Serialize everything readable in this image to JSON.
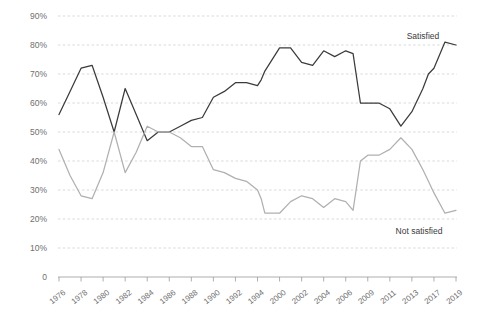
{
  "chart_data": {
    "type": "line",
    "title": "",
    "subtitle": "",
    "xlabel": "",
    "ylabel": "",
    "grid": true,
    "legend_position": "inline-end-labels",
    "ylim": [
      0,
      90
    ],
    "ytick_labels": [
      "90%",
      "80%",
      "70%",
      "60%",
      "50%",
      "40%",
      "30%",
      "20%",
      "10%",
      "0"
    ],
    "ytick_values": [
      90,
      80,
      70,
      60,
      50,
      40,
      30,
      20,
      10,
      0
    ],
    "categories": [
      "1976",
      "1978",
      "1980",
      "1982",
      "1984",
      "1986",
      "1988",
      "1990",
      "1992",
      "1994",
      "2000",
      "2002",
      "2004",
      "2006",
      "2009",
      "2011",
      "2013",
      "2017",
      "2019"
    ],
    "x": [
      1976,
      1978,
      1980,
      1982,
      1984,
      1986,
      1988,
      1990,
      1992,
      1994,
      2000,
      2002,
      2004,
      2006,
      2009,
      2011,
      2013,
      2017,
      2019
    ],
    "series": [
      {
        "name": "Satisfied",
        "color": "#3b3b3b",
        "label_text": "Satisfied",
        "values": [
          56,
          72,
          73,
          50,
          65,
          47,
          54,
          55,
          62,
          71,
          79,
          74,
          78,
          60,
          60,
          52,
          65,
          78,
          80
        ],
        "detail_points": [
          {
            "x": 1976,
            "y": 56
          },
          {
            "x": 1977,
            "y": 64
          },
          {
            "x": 1978,
            "y": 72
          },
          {
            "x": 1979,
            "y": 73
          },
          {
            "x": 1980,
            "y": 62
          },
          {
            "x": 1981,
            "y": 50
          },
          {
            "x": 1982,
            "y": 65
          },
          {
            "x": 1983,
            "y": 56
          },
          {
            "x": 1984,
            "y": 47
          },
          {
            "x": 1985,
            "y": 50
          },
          {
            "x": 1986,
            "y": 50
          },
          {
            "x": 1987,
            "y": 52
          },
          {
            "x": 1988,
            "y": 54
          },
          {
            "x": 1989,
            "y": 55
          },
          {
            "x": 1990,
            "y": 62
          },
          {
            "x": 1991,
            "y": 64
          },
          {
            "x": 1992,
            "y": 67
          },
          {
            "x": 1993,
            "y": 67
          },
          {
            "x": 1994,
            "y": 66
          },
          {
            "x": 1995,
            "y": 68
          },
          {
            "x": 1996,
            "y": 71
          },
          {
            "x": 2000,
            "y": 79
          },
          {
            "x": 2001,
            "y": 79
          },
          {
            "x": 2002,
            "y": 74
          },
          {
            "x": 2003,
            "y": 73
          },
          {
            "x": 2004,
            "y": 78
          },
          {
            "x": 2005,
            "y": 76
          },
          {
            "x": 2006,
            "y": 78
          },
          {
            "x": 2007,
            "y": 77
          },
          {
            "x": 2008,
            "y": 60
          },
          {
            "x": 2009,
            "y": 60
          },
          {
            "x": 2010,
            "y": 60
          },
          {
            "x": 2011,
            "y": 58
          },
          {
            "x": 2012,
            "y": 52
          },
          {
            "x": 2013,
            "y": 57
          },
          {
            "x": 2015,
            "y": 65
          },
          {
            "x": 2016,
            "y": 70
          },
          {
            "x": 2017,
            "y": 72
          },
          {
            "x": 2018,
            "y": 81
          },
          {
            "x": 2019,
            "y": 80
          }
        ]
      },
      {
        "name": "Not satisfied",
        "color": "#b0b0b0",
        "label_text": "Not satisfied",
        "values": [
          44,
          28,
          36,
          50,
          32,
          52,
          45,
          44,
          37,
          30,
          22,
          28,
          25,
          29,
          43,
          48,
          40,
          23,
          22
        ],
        "detail_points": [
          {
            "x": 1976,
            "y": 44
          },
          {
            "x": 1977,
            "y": 35
          },
          {
            "x": 1978,
            "y": 28
          },
          {
            "x": 1979,
            "y": 27
          },
          {
            "x": 1980,
            "y": 36
          },
          {
            "x": 1981,
            "y": 50
          },
          {
            "x": 1982,
            "y": 36
          },
          {
            "x": 1983,
            "y": 43
          },
          {
            "x": 1984,
            "y": 52
          },
          {
            "x": 1985,
            "y": 50
          },
          {
            "x": 1986,
            "y": 50
          },
          {
            "x": 1987,
            "y": 48
          },
          {
            "x": 1988,
            "y": 45
          },
          {
            "x": 1989,
            "y": 45
          },
          {
            "x": 1990,
            "y": 37
          },
          {
            "x": 1991,
            "y": 36
          },
          {
            "x": 1992,
            "y": 34
          },
          {
            "x": 1993,
            "y": 33
          },
          {
            "x": 1994,
            "y": 30
          },
          {
            "x": 1995,
            "y": 27
          },
          {
            "x": 1996,
            "y": 22
          },
          {
            "x": 2000,
            "y": 22
          },
          {
            "x": 2001,
            "y": 26
          },
          {
            "x": 2002,
            "y": 28
          },
          {
            "x": 2003,
            "y": 27
          },
          {
            "x": 2004,
            "y": 24
          },
          {
            "x": 2005,
            "y": 27
          },
          {
            "x": 2006,
            "y": 26
          },
          {
            "x": 2007,
            "y": 23
          },
          {
            "x": 2008,
            "y": 40
          },
          {
            "x": 2009,
            "y": 42
          },
          {
            "x": 2010,
            "y": 42
          },
          {
            "x": 2011,
            "y": 44
          },
          {
            "x": 2012,
            "y": 48
          },
          {
            "x": 2013,
            "y": 44
          },
          {
            "x": 2015,
            "y": 37
          },
          {
            "x": 2016,
            "y": 33
          },
          {
            "x": 2017,
            "y": 29
          },
          {
            "x": 2018,
            "y": 22
          },
          {
            "x": 2019,
            "y": 23
          }
        ]
      }
    ]
  }
}
